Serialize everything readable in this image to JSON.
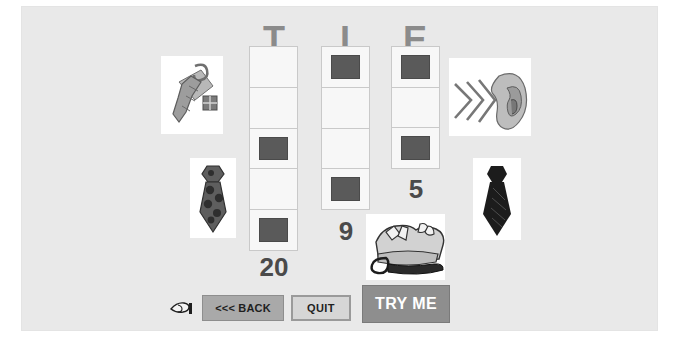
{
  "app": {
    "word": "TIE",
    "background_color": "#e9e9e9",
    "page_background": "#ffffff"
  },
  "columns": [
    {
      "letter": "T",
      "value_label": "20",
      "cell_count": 5,
      "filled_cells": [
        3,
        5
      ],
      "cells": [
        "empty",
        "empty",
        "filled",
        "empty",
        "filled"
      ]
    },
    {
      "letter": "I",
      "value_label": "9",
      "cell_count": 4,
      "filled_cells": [
        1,
        4
      ],
      "cells": [
        "filled",
        "empty",
        "empty",
        "filled"
      ]
    },
    {
      "letter": "E",
      "value_label": "5",
      "cell_count": 3,
      "filled_cells": [
        1,
        3
      ],
      "cells": [
        "filled",
        "empty",
        "filled"
      ]
    }
  ],
  "pictures": [
    {
      "name": "tie-with-gift-box-image",
      "alt": "necktie draped over a gift box"
    },
    {
      "name": "polka-dot-tie-image",
      "alt": "necktie with polka dot pattern"
    },
    {
      "name": "ear-listening-image",
      "alt": "ear with sound waves"
    },
    {
      "name": "black-tie-image",
      "alt": "solid dark necktie"
    },
    {
      "name": "shirts-and-tie-image",
      "alt": "folded shirts with a necktie"
    }
  ],
  "toolbar": {
    "cursor_icon": "pointing-hand-icon",
    "back_label": "<<< BACK",
    "quit_label": "QUIT",
    "try_me_label": "TRY ME"
  },
  "colors": {
    "panel": "#e9e9e9",
    "letter": "#8b8b8b",
    "marker": "#5a5a5a",
    "value_text": "#4a4a4a",
    "back_button": "#a9a9a9",
    "quit_button": "#d6d6d6",
    "try_me_button": "#8e8e8e"
  }
}
